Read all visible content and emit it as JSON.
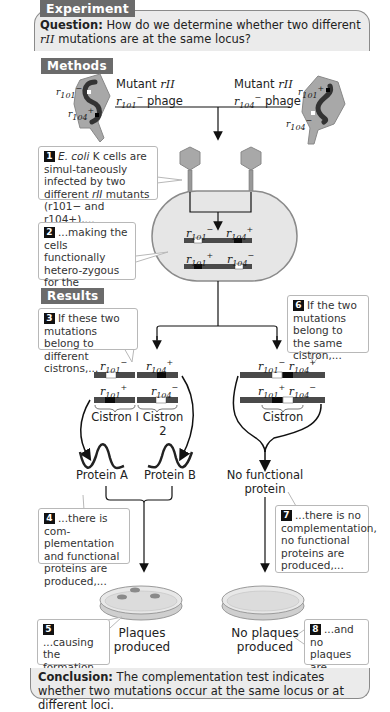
{
  "header": {
    "tag": "Experiment",
    "question_label": "Question:",
    "question_text_1": "How do we determine whether two different",
    "question_gene": "rII",
    "question_text_2": "mutations are at the same locus?"
  },
  "methods": {
    "tag": "Methods",
    "phage_left": {
      "line1": "Mutant",
      "gene": "rII",
      "allele": "r",
      "sub": "101",
      "sup": "−",
      "suffix": "phage"
    },
    "phage_right": {
      "line1": "Mutant",
      "gene": "rII",
      "allele": "r",
      "sub": "104",
      "sup": "−",
      "suffix": "phage"
    },
    "left_phage_labels": [
      "r101−",
      "r104+"
    ],
    "right_phage_labels": [
      "r101+",
      "r104−"
    ],
    "step1": {
      "num": "1",
      "text_a": "E. coli",
      "text_b": " K cells are simul-taneously infected by two different ",
      "text_c": "rII",
      "text_d": " mutants (r101− and r104+),..."
    },
    "step2": {
      "num": "2",
      "text": "...making the cells functionally hetero-zygous for the mutations."
    },
    "cell_labels": {
      "top_left": "r101−",
      "top_right": "r104+",
      "bottom_left": "r101+",
      "bottom_right": "r104−"
    }
  },
  "results": {
    "tag": "Results",
    "step3": {
      "num": "3",
      "text": "If these two mutations belong to different cistrons,..."
    },
    "step6": {
      "num": "6",
      "text": "If the two mutations belong to the same cistron,..."
    },
    "left_chrom_labels": {
      "top_left": "r101−",
      "top_right": "r104+",
      "bottom_left": "r101+",
      "bottom_right": "r104−"
    },
    "right_chrom_labels": {
      "top": "r101− r104+",
      "bottom": "r101+ r104−"
    },
    "cistron1": "Cistron I",
    "cistron2": "Cistron 2",
    "cistron": "Cistron",
    "protein_a": "Protein A",
    "protein_b": "Protein B",
    "no_protein_1": "No functional",
    "no_protein_2": "protein",
    "step4": {
      "num": "4",
      "text": "...there is com-plementation and functional proteins are produced,..."
    },
    "step7": {
      "num": "7",
      "text": "...there is no complementation, no functional proteins are produced,..."
    },
    "step5": {
      "num": "5",
      "text": "...causing the formation of plaques."
    },
    "step8": {
      "num": "8",
      "text": "...and no plaques are formed."
    },
    "plaques_1": "Plaques",
    "plaques_2": "produced",
    "no_plaques_1": "No plaques",
    "no_plaques_2": "produced"
  },
  "conclusion": {
    "label": "Conclusion:",
    "text": "The complementation test indicates whether two mutations occur at the same locus or at different loci."
  },
  "colors": {
    "tag_bg": "#6b6b6b",
    "panel_bg": "#ebebeb",
    "phage_gray": "#a8a8a8",
    "cell_bg": "#e6e6e6",
    "chrom_dark": "#4a4a4a",
    "mutation_black": "#0a0a0a",
    "mutation_white": "#ffffff"
  }
}
